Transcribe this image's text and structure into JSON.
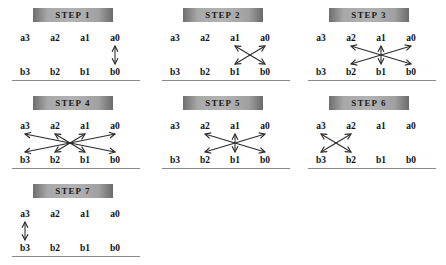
{
  "diagram": {
    "background_color": "#ffffff",
    "header_color": "#a8a8a8",
    "line_color": "#2b2b2b",
    "baseline_color": "#8a8a8a",
    "top_row_labels": [
      "a3",
      "a2",
      "a1",
      "a0"
    ],
    "bottom_row_labels": [
      "b3",
      "b2",
      "b1",
      "b0"
    ]
  },
  "panels": [
    {
      "id": "step-1",
      "header": "STEP 1",
      "top_labels": [
        "a3",
        "a2",
        "a1",
        "a0"
      ],
      "bottom_labels": [
        "b3",
        "b2",
        "b1",
        "b0"
      ],
      "connections": [
        {
          "from": "a0",
          "to": "b0",
          "style": "double-arrow",
          "shape": "vertical"
        }
      ]
    },
    {
      "id": "step-2",
      "header": "STEP 2",
      "top_labels": [
        "a3",
        "a2",
        "a1",
        "a0"
      ],
      "bottom_labels": [
        "b3",
        "b2",
        "b1",
        "b0"
      ],
      "connections": [
        {
          "from": "a1",
          "to": "b0",
          "style": "double-arrow",
          "shape": "diagonal"
        },
        {
          "from": "a0",
          "to": "b1",
          "style": "double-arrow",
          "shape": "diagonal"
        }
      ]
    },
    {
      "id": "step-3",
      "header": "STEP 3",
      "top_labels": [
        "a3",
        "a2",
        "a1",
        "a0"
      ],
      "bottom_labels": [
        "b3",
        "b2",
        "b1",
        "b0"
      ],
      "connections": [
        {
          "from": "a1",
          "to": "b1",
          "style": "double-arrow",
          "shape": "vertical"
        },
        {
          "from": "a2",
          "to": "b0",
          "style": "double-arrow",
          "shape": "diagonal"
        },
        {
          "from": "a0",
          "to": "b2",
          "style": "double-arrow",
          "shape": "diagonal"
        }
      ]
    },
    {
      "id": "step-4",
      "header": "STEP 4",
      "top_labels": [
        "a3",
        "a2",
        "a1",
        "a0"
      ],
      "bottom_labels": [
        "b3",
        "b2",
        "b1",
        "b0"
      ],
      "connections": [
        {
          "from": "a3",
          "to": "b0",
          "style": "double-arrow",
          "shape": "diagonal"
        },
        {
          "from": "a2",
          "to": "b1",
          "style": "double-arrow",
          "shape": "diagonal"
        },
        {
          "from": "a1",
          "to": "b2",
          "style": "double-arrow",
          "shape": "diagonal"
        },
        {
          "from": "a0",
          "to": "b3",
          "style": "double-arrow",
          "shape": "diagonal"
        }
      ]
    },
    {
      "id": "step-5",
      "header": "STEP 5",
      "top_labels": [
        "a3",
        "a2",
        "a1",
        "a0"
      ],
      "bottom_labels": [
        "b3",
        "b2",
        "b1",
        "b0"
      ],
      "connections": [
        {
          "from": "a1",
          "to": "b1",
          "style": "double-arrow",
          "shape": "vertical"
        },
        {
          "from": "a2",
          "to": "b0",
          "style": "double-arrow",
          "shape": "diagonal"
        },
        {
          "from": "a0",
          "to": "b2",
          "style": "double-arrow",
          "shape": "diagonal"
        }
      ]
    },
    {
      "id": "step-6",
      "header": "STEP 6",
      "top_labels": [
        "a3",
        "a2",
        "a1",
        "a0"
      ],
      "bottom_labels": [
        "b3",
        "b2",
        "b1",
        "b0"
      ],
      "connections": [
        {
          "from": "a3",
          "to": "b2",
          "style": "double-arrow",
          "shape": "diagonal"
        },
        {
          "from": "a2",
          "to": "b3",
          "style": "double-arrow",
          "shape": "diagonal"
        }
      ]
    },
    {
      "id": "step-7",
      "header": "STEP 7",
      "top_labels": [
        "a3",
        "a2",
        "a1",
        "a0"
      ],
      "bottom_labels": [
        "b3",
        "b2",
        "b1",
        "b0"
      ],
      "connections": [
        {
          "from": "a3",
          "to": "b3",
          "style": "double-arrow",
          "shape": "vertical"
        }
      ]
    }
  ]
}
